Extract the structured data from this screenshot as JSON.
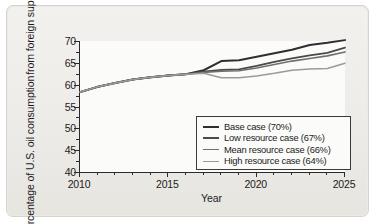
{
  "chart_data": {
    "type": "line",
    "title": "",
    "xlabel": "Year",
    "ylabel_line1": "Percentage of U.S. oil consumption",
    "ylabel_line2": "from foreign suppliers",
    "xlim": [
      2010,
      2025
    ],
    "ylim": [
      40,
      70
    ],
    "x_ticks": [
      2010,
      2015,
      2020,
      2025
    ],
    "x_tick_labels": [
      "2010",
      "2015",
      "2020",
      "2025"
    ],
    "x_minor_ticks": [
      2011,
      2012,
      2013,
      2014,
      2016,
      2017,
      2018,
      2019,
      2021,
      2022,
      2023,
      2024
    ],
    "y_ticks": [
      40,
      45,
      50,
      55,
      60,
      65,
      70
    ],
    "y_tick_labels": [
      "40",
      "45",
      "50",
      "55",
      "60",
      "65",
      "70"
    ],
    "y_minor_ticks": [
      42.5,
      47.5,
      52.5,
      57.5,
      62.5,
      67.5
    ],
    "grid": false,
    "legend_position": "lower right",
    "x": [
      2010,
      2011,
      2012,
      2013,
      2014,
      2015,
      2016,
      2017,
      2018,
      2019,
      2020,
      2021,
      2022,
      2023,
      2024,
      2025
    ],
    "series": [
      {
        "name": "Base case (70%)",
        "color": "#2f2f2f",
        "width": 2.0,
        "values": [
          58.3,
          59.5,
          60.4,
          61.2,
          61.7,
          62.1,
          62.4,
          63.3,
          65.4,
          65.6,
          66.4,
          67.2,
          68.0,
          69.1,
          69.6,
          70.2
        ]
      },
      {
        "name": "Low resource case (67%)",
        "color": "#4a4a4a",
        "width": 1.8,
        "values": [
          58.3,
          59.5,
          60.4,
          61.2,
          61.7,
          62.1,
          62.4,
          63.0,
          63.4,
          63.5,
          64.3,
          65.2,
          66.0,
          66.7,
          67.3,
          68.5
        ]
      },
      {
        "name": "Mean resource case (66%)",
        "color": "#707070",
        "width": 1.6,
        "values": [
          58.3,
          59.5,
          60.4,
          61.2,
          61.7,
          62.1,
          62.4,
          62.8,
          63.1,
          63.2,
          63.8,
          64.6,
          65.4,
          66.0,
          66.6,
          67.5
        ]
      },
      {
        "name": "High resource case (64%)",
        "color": "#9a9a9a",
        "width": 1.5,
        "values": [
          58.3,
          59.5,
          60.4,
          61.2,
          61.7,
          62.1,
          62.4,
          62.6,
          61.6,
          61.6,
          62.0,
          62.6,
          63.3,
          63.6,
          63.7,
          64.9
        ]
      }
    ]
  },
  "legend": {
    "items": [
      {
        "label": "Base case (70%)",
        "color": "#2f2f2f",
        "thickness": "2.4px"
      },
      {
        "label": "Low resource case (67%)",
        "color": "#4a4a4a",
        "thickness": "2.2px"
      },
      {
        "label": "Mean resource case (66%)",
        "color": "#707070",
        "thickness": "1.9px"
      },
      {
        "label": "High resource case (64%)",
        "color": "#9a9a9a",
        "thickness": "1.7px"
      }
    ]
  },
  "colors": {
    "card_background": "#efedea",
    "plot_background": "#fbfbfa",
    "axis": "#2a2a2a",
    "text": "#1b1b1b"
  }
}
